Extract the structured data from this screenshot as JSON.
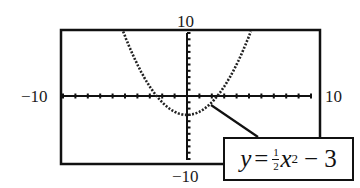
{
  "chart_data": {
    "type": "line",
    "title": "",
    "equation": "y = (1/2)x^2 - 3",
    "equation_parts": {
      "lhs": "y",
      "equals": "=",
      "frac_num": "1",
      "frac_den": "2",
      "var": "x",
      "exp": "2",
      "rest": "− 3"
    },
    "xlim": [
      -10,
      10
    ],
    "ylim": [
      -10,
      10
    ],
    "xscale": 1,
    "yscale": 1,
    "tick_labels": {
      "xmin": "−10",
      "xmax": "10",
      "ymin": "−10",
      "ymax": "10"
    },
    "grid": false,
    "series": [
      {
        "name": "y = 1/2 x^2 - 3",
        "style": "dotted",
        "x": [
          -6,
          -5,
          -4,
          -3,
          -2,
          -1,
          0,
          1,
          2,
          3,
          4,
          5,
          6
        ],
        "y": [
          15,
          9.5,
          5,
          1.5,
          -1,
          -2.5,
          -3,
          -2.5,
          -1,
          1.5,
          5,
          9.5,
          15
        ]
      }
    ],
    "annotations": [
      {
        "text": "y = ½ x² − 3",
        "points_to": [
          1.9,
          -1.2
        ]
      }
    ]
  }
}
